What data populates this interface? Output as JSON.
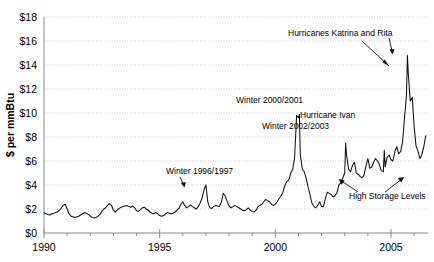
{
  "chart_data": {
    "type": "line",
    "title": "",
    "xlabel": "",
    "ylabel": "$ per mmBtu",
    "xlim": [
      1990,
      2006.6
    ],
    "ylim": [
      0,
      18
    ],
    "grid": true,
    "legend": "none",
    "x_ticks_major": [
      "1990",
      "1995",
      "2000",
      "2005"
    ],
    "x_tick_values_major": [
      1990,
      1995,
      2000,
      2005
    ],
    "x_tick_values_minor": [
      1991,
      1992,
      1993,
      1994,
      1996,
      1997,
      1998,
      1999,
      2001,
      2002,
      2003,
      2004,
      2006
    ],
    "y_ticks": [
      "$0",
      "$2",
      "$4",
      "$6",
      "$8",
      "$10",
      "$12",
      "$14",
      "$16",
      "$18"
    ],
    "y_tick_values": [
      0,
      2,
      4,
      6,
      8,
      10,
      12,
      14,
      16,
      18
    ],
    "series": [
      {
        "name": "Natural gas spot price",
        "color": "#111111",
        "x": [
          1990.0,
          1990.08,
          1990.17,
          1990.25,
          1990.33,
          1990.42,
          1990.5,
          1990.58,
          1990.67,
          1990.75,
          1990.83,
          1990.92,
          1991.0,
          1991.08,
          1991.17,
          1991.25,
          1991.33,
          1991.42,
          1991.5,
          1991.58,
          1991.67,
          1991.75,
          1991.83,
          1991.92,
          1992.0,
          1992.08,
          1992.17,
          1992.25,
          1992.33,
          1992.42,
          1992.5,
          1992.58,
          1992.67,
          1992.75,
          1992.83,
          1992.92,
          1993.0,
          1993.08,
          1993.17,
          1993.25,
          1993.33,
          1993.42,
          1993.5,
          1993.58,
          1993.67,
          1993.75,
          1993.83,
          1993.92,
          1994.0,
          1994.08,
          1994.17,
          1994.25,
          1994.33,
          1994.42,
          1994.5,
          1994.58,
          1994.67,
          1994.75,
          1994.83,
          1994.92,
          1995.0,
          1995.08,
          1995.17,
          1995.25,
          1995.33,
          1995.42,
          1995.5,
          1995.58,
          1995.67,
          1995.75,
          1995.83,
          1995.92,
          1996.0,
          1996.08,
          1996.17,
          1996.25,
          1996.33,
          1996.42,
          1996.5,
          1996.58,
          1996.67,
          1996.75,
          1996.83,
          1996.92,
          1997.0,
          1997.08,
          1997.17,
          1997.25,
          1997.33,
          1997.42,
          1997.5,
          1997.58,
          1997.67,
          1997.75,
          1997.83,
          1997.92,
          1998.0,
          1998.08,
          1998.17,
          1998.25,
          1998.33,
          1998.42,
          1998.5,
          1998.58,
          1998.67,
          1998.75,
          1998.83,
          1998.92,
          1999.0,
          1999.08,
          1999.17,
          1999.25,
          1999.33,
          1999.42,
          1999.5,
          1999.58,
          1999.67,
          1999.75,
          1999.83,
          1999.92,
          2000.0,
          2000.08,
          2000.17,
          2000.25,
          2000.33,
          2000.42,
          2000.5,
          2000.58,
          2000.67,
          2000.75,
          2000.83,
          2000.92,
          2001.0,
          2001.04,
          2001.08,
          2001.17,
          2001.25,
          2001.33,
          2001.42,
          2001.5,
          2001.58,
          2001.67,
          2001.75,
          2001.83,
          2001.92,
          2002.0,
          2002.08,
          2002.17,
          2002.25,
          2002.33,
          2002.42,
          2002.5,
          2002.58,
          2002.67,
          2002.75,
          2002.83,
          2002.92,
          2003.0,
          2003.04,
          2003.08,
          2003.17,
          2003.25,
          2003.33,
          2003.42,
          2003.5,
          2003.58,
          2003.67,
          2003.75,
          2003.83,
          2003.92,
          2004.0,
          2004.08,
          2004.17,
          2004.25,
          2004.33,
          2004.42,
          2004.5,
          2004.58,
          2004.67,
          2004.71,
          2004.75,
          2004.83,
          2004.92,
          2005.0,
          2005.08,
          2005.17,
          2005.25,
          2005.33,
          2005.42,
          2005.5,
          2005.58,
          2005.67,
          2005.71,
          2005.75,
          2005.79,
          2005.83,
          2005.92,
          2006.0,
          2006.08,
          2006.17,
          2006.25,
          2006.33,
          2006.42,
          2006.5
        ],
        "y": [
          1.7,
          1.6,
          1.55,
          1.5,
          1.6,
          1.65,
          1.7,
          1.75,
          1.9,
          2.1,
          2.3,
          2.4,
          2.0,
          1.6,
          1.4,
          1.35,
          1.3,
          1.35,
          1.4,
          1.5,
          1.6,
          1.7,
          1.65,
          1.55,
          1.4,
          1.3,
          1.25,
          1.3,
          1.4,
          1.55,
          1.8,
          2.0,
          2.1,
          2.3,
          2.45,
          2.3,
          1.9,
          1.75,
          1.9,
          2.05,
          2.15,
          2.2,
          2.25,
          2.3,
          2.2,
          2.15,
          2.25,
          2.1,
          1.85,
          1.8,
          1.95,
          2.1,
          2.15,
          2.0,
          1.9,
          1.75,
          1.65,
          1.6,
          1.7,
          1.6,
          1.45,
          1.4,
          1.45,
          1.6,
          1.7,
          1.65,
          1.6,
          1.65,
          1.75,
          1.9,
          2.05,
          2.4,
          2.6,
          2.3,
          2.1,
          2.2,
          2.35,
          2.2,
          2.1,
          2.0,
          2.2,
          2.5,
          2.9,
          3.6,
          4.0,
          2.6,
          2.1,
          2.05,
          2.2,
          2.3,
          2.25,
          2.2,
          2.6,
          3.3,
          3.1,
          2.6,
          2.25,
          2.1,
          2.2,
          2.3,
          2.2,
          2.1,
          2.0,
          1.9,
          1.85,
          1.95,
          2.1,
          1.9,
          1.8,
          1.75,
          1.9,
          2.2,
          2.3,
          2.4,
          2.6,
          2.8,
          2.7,
          2.6,
          2.4,
          2.3,
          2.4,
          2.6,
          2.9,
          3.1,
          3.4,
          4.0,
          4.3,
          4.4,
          5.0,
          5.3,
          6.2,
          9.8,
          9.6,
          9.9,
          6.5,
          5.3,
          5.1,
          4.6,
          3.8,
          3.2,
          2.5,
          2.2,
          2.1,
          2.3,
          2.6,
          2.2,
          2.2,
          2.9,
          3.4,
          3.3,
          3.2,
          3.0,
          3.1,
          3.4,
          4.0,
          4.2,
          4.6,
          5.0,
          7.5,
          6.5,
          5.3,
          5.1,
          5.6,
          5.9,
          5.0,
          4.9,
          4.7,
          4.6,
          4.8,
          5.6,
          6.2,
          5.4,
          5.5,
          5.9,
          6.2,
          6.0,
          5.7,
          5.2,
          5.1,
          6.9,
          5.5,
          6.3,
          6.5,
          6.1,
          6.0,
          6.8,
          7.2,
          6.6,
          6.8,
          7.6,
          9.5,
          11.5,
          14.8,
          13.2,
          12.2,
          11.0,
          11.3,
          8.9,
          7.3,
          6.8,
          6.2,
          6.5,
          7.2,
          8.1
        ]
      }
    ],
    "annotations": [
      {
        "id": "katrina",
        "label": "Hurricanes Katrina and Rita"
      },
      {
        "id": "winter2000",
        "label": "Winter 2000/2001"
      },
      {
        "id": "ivan",
        "label": "Hurricane Ivan"
      },
      {
        "id": "winter2002",
        "label": "Winter 2002/2003"
      },
      {
        "id": "winter1996",
        "label": "Winter 1996/1997"
      },
      {
        "id": "storage",
        "label": "High Storage Levels"
      }
    ],
    "colors": {
      "series": "#111111",
      "grid": "#b9b9b9",
      "axis": "#8a8a8a",
      "background": "#ffffff",
      "text": "#000000"
    }
  }
}
